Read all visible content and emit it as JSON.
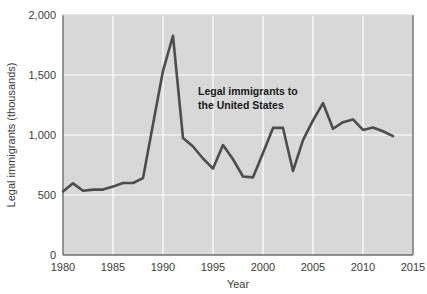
{
  "chart_data": {
    "type": "line",
    "title": "",
    "xlabel": "Year",
    "ylabel": "Legal immigrants (thousands)",
    "xlim": [
      1980,
      2015
    ],
    "ylim": [
      0,
      2000
    ],
    "xticks": [
      1980,
      1985,
      1990,
      1995,
      2000,
      2005,
      2010,
      2015
    ],
    "xtick_labels": [
      "1980",
      "1985",
      "1990",
      "1995",
      "2000",
      "2005",
      "2010",
      "2015"
    ],
    "yticks": [
      0,
      500,
      1000,
      1500,
      2000
    ],
    "ytick_labels": [
      "0",
      "500",
      "1,000",
      "1,500",
      "2,000"
    ],
    "grid": true,
    "grid_color": "#ffffff",
    "plot_background": "#d8d8d8",
    "legend": null,
    "series": [
      {
        "name": "Legal immigrants to the United States",
        "color": "#4d4d4d",
        "x": [
          1980,
          1981,
          1982,
          1983,
          1984,
          1985,
          1986,
          1987,
          1988,
          1989,
          1990,
          1991,
          1992,
          1993,
          1994,
          1995,
          1996,
          1997,
          1998,
          1999,
          2000,
          2001,
          2002,
          2003,
          2004,
          2005,
          2006,
          2007,
          2008,
          2009,
          2010,
          2011,
          2012,
          2013
        ],
        "values": [
          530,
          597,
          535,
          545,
          545,
          570,
          600,
          600,
          640,
          1090,
          1535,
          1827,
          974,
          904,
          804,
          720,
          916,
          798,
          654,
          647,
          850,
          1059,
          1059,
          700,
          958,
          1122,
          1266,
          1052,
          1107,
          1130,
          1042,
          1062,
          1031,
          990
        ]
      }
    ],
    "annotations": [
      {
        "name": "series-callout",
        "line1": "Legal immigrants to",
        "line2": "the United States",
        "x": 1993.5,
        "y": 1330
      }
    ]
  }
}
